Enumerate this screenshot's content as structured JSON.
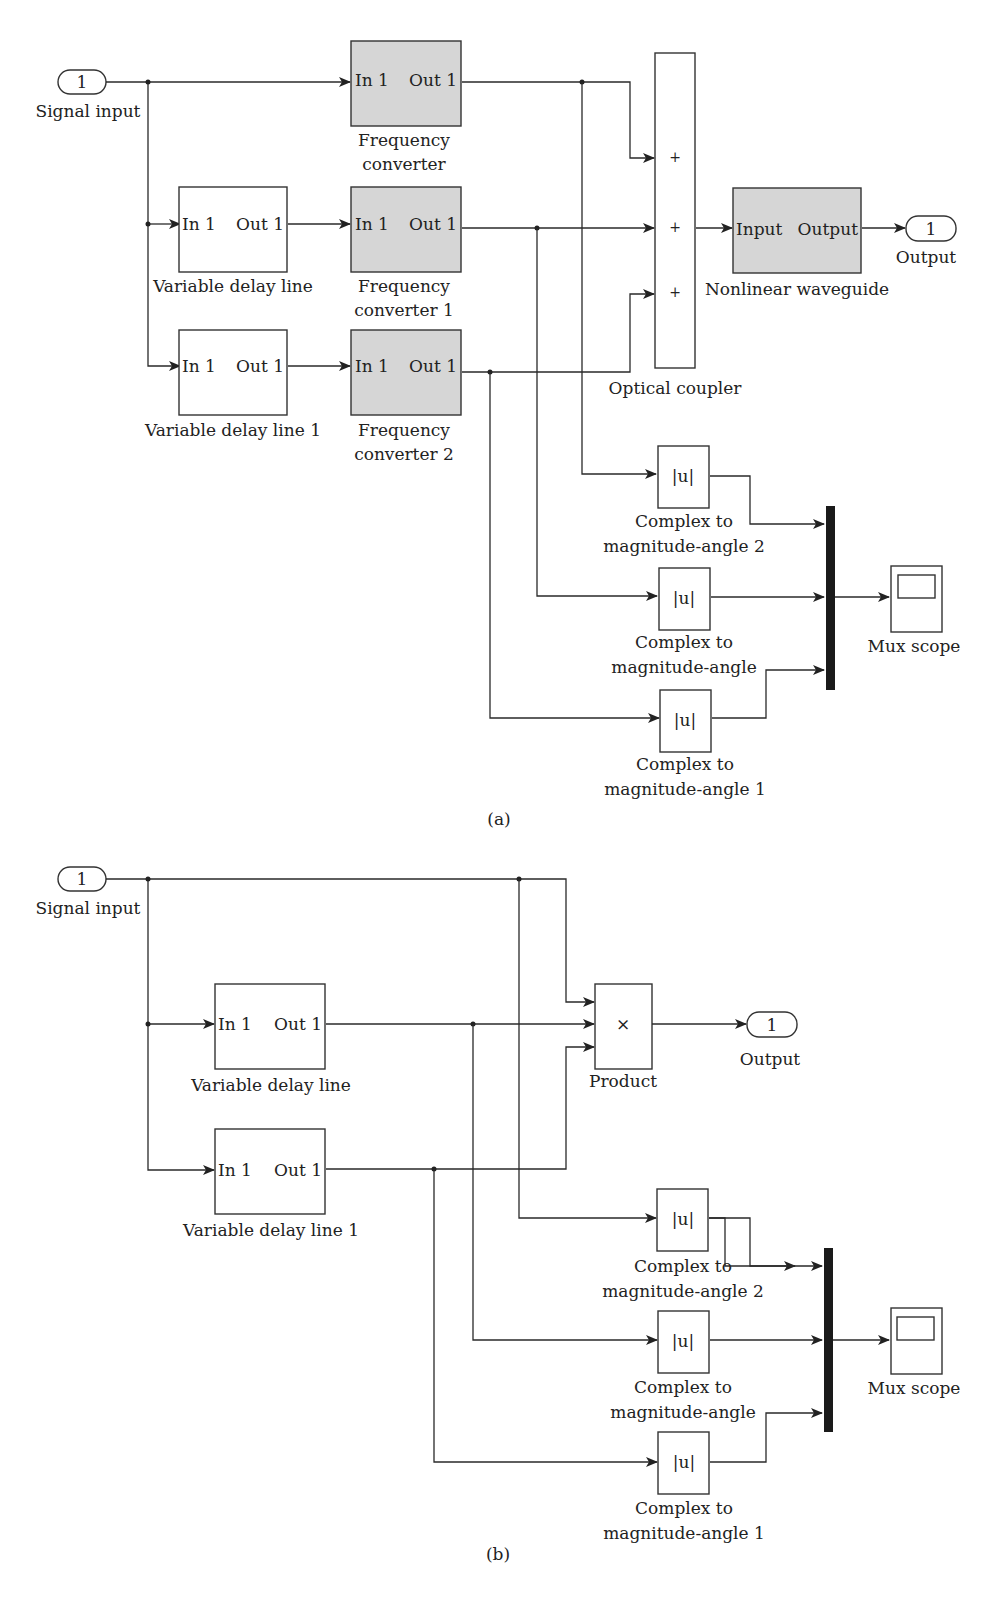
{
  "panel_a": {
    "caption": "(a)",
    "signal_input": {
      "value": "1",
      "label": "Signal input"
    },
    "freq_converter": {
      "in": "In 1",
      "out": "Out 1",
      "label1": "Frequency",
      "label2": "converter"
    },
    "freq_converter_1": {
      "in": "In 1",
      "out": "Out 1",
      "label1": "Frequency",
      "label2": "converter 1"
    },
    "freq_converter_2": {
      "in": "In 1",
      "out": "Out 1",
      "label1": "Frequency",
      "label2": "converter 2"
    },
    "delay_line": {
      "in": "In 1",
      "out": "Out 1",
      "label": "Variable delay line"
    },
    "delay_line_1": {
      "in": "In 1",
      "out": "Out 1",
      "label": "Variable delay line 1"
    },
    "optical_coupler": {
      "signs": [
        "+",
        "+",
        "+"
      ],
      "label": "Optical coupler"
    },
    "nonlinear_waveguide": {
      "in": "Input",
      "out": "Output",
      "label": "Nonlinear waveguide"
    },
    "output": {
      "value": "1",
      "label": "Output"
    },
    "abs_blocks": [
      {
        "symbol": "|u|",
        "label1": "Complex to",
        "label2": "magnitude-angle 2"
      },
      {
        "symbol": "|u|",
        "label1": "Complex to",
        "label2": "magnitude-angle"
      },
      {
        "symbol": "|u|",
        "label1": "Complex to",
        "label2": "magnitude-angle 1"
      }
    ],
    "mux_scope": {
      "label": "Mux scope"
    }
  },
  "panel_b": {
    "caption": "(b)",
    "signal_input": {
      "value": "1",
      "label": "Signal input"
    },
    "delay_line": {
      "in": "In 1",
      "out": "Out 1",
      "label": "Variable delay line"
    },
    "delay_line_1": {
      "in": "In 1",
      "out": "Out 1",
      "label": "Variable delay line 1"
    },
    "product": {
      "symbol": "×",
      "label": "Product"
    },
    "output": {
      "value": "1",
      "label": "Output"
    },
    "abs_blocks": [
      {
        "symbol": "|u|",
        "label1": "Complex to",
        "label2": "magnitude-angle 2"
      },
      {
        "symbol": "|u|",
        "label1": "Complex to",
        "label2": "magnitude-angle"
      },
      {
        "symbol": "|u|",
        "label1": "Complex to",
        "label2": "magnitude-angle 1"
      }
    ],
    "mux_scope": {
      "label": "Mux scope"
    }
  }
}
